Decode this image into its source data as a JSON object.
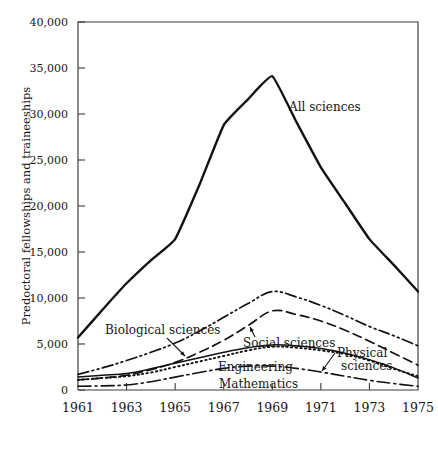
{
  "chart_data": {
    "type": "line",
    "title": "",
    "xlabel": "",
    "ylabel": "Predoctoral fellowships and traineeships",
    "x": [
      1961,
      1962,
      1963,
      1964,
      1965,
      1966,
      1967,
      1968,
      1969,
      1970,
      1971,
      1972,
      1973,
      1974,
      1975
    ],
    "xlim": [
      1961,
      1975
    ],
    "ylim": [
      0,
      40000
    ],
    "xticks": [
      1961,
      1963,
      1965,
      1967,
      1969,
      1971,
      1973,
      1975
    ],
    "xtick_labels": [
      "1961",
      "1963",
      "1965",
      "1967",
      "1969",
      "1971",
      "1973",
      "1975"
    ],
    "yticks": [
      0,
      5000,
      10000,
      15000,
      20000,
      25000,
      30000,
      35000,
      40000
    ],
    "ytick_labels": [
      "0",
      "5,000",
      "10,000",
      "15,000",
      "20,000",
      "25,000",
      "30,000",
      "35,000",
      "40,000"
    ],
    "grid": false,
    "legend_position": "inline-annotations",
    "series": [
      {
        "name": "All sciences",
        "label": "All sciences",
        "line_style": "solid",
        "line_width": 2.4,
        "color": "#121212",
        "values": [
          5700,
          8700,
          11600,
          14100,
          16400,
          22300,
          28800,
          31600,
          34100,
          29100,
          24200,
          20300,
          16400,
          13600,
          10700
        ]
      },
      {
        "name": "Biological sciences",
        "label": "Biological sciences",
        "line_style": "dash-dot-dot",
        "line_width": 1.7,
        "color": "#121212",
        "values": [
          1700,
          2400,
          3200,
          4100,
          5100,
          6400,
          7900,
          9400,
          10700,
          10100,
          9200,
          8100,
          6900,
          5900,
          4800
        ]
      },
      {
        "name": "Social sciences",
        "label": "Social sciences",
        "line_style": "dashed",
        "line_width": 1.7,
        "color": "#121212",
        "values": [
          1100,
          1300,
          1600,
          2200,
          3000,
          4100,
          5400,
          7000,
          8600,
          8200,
          7500,
          6500,
          5300,
          4000,
          2700
        ]
      },
      {
        "name": "Engineering",
        "label": "Engineering",
        "line_style": "solid",
        "line_width": 1.5,
        "color": "#121212",
        "values": [
          1400,
          1600,
          1800,
          2300,
          2900,
          3500,
          4100,
          4600,
          4900,
          4800,
          4500,
          4000,
          3300,
          2400,
          1300
        ]
      },
      {
        "name": "Physical sciences",
        "label": "Physical sciences",
        "line_style": "dotted",
        "line_width": 1.9,
        "color": "#121212",
        "values": [
          1100,
          1300,
          1500,
          1900,
          2500,
          3100,
          3700,
          4300,
          4700,
          4600,
          4300,
          3900,
          3200,
          2300,
          1500
        ]
      },
      {
        "name": "Mathematics",
        "label": "Mathematics",
        "line_style": "dash-dot",
        "line_width": 1.6,
        "color": "#121212",
        "values": [
          400,
          450,
          550,
          900,
          1400,
          1900,
          2350,
          2600,
          2600,
          2350,
          1950,
          1500,
          1050,
          700,
          400
        ]
      }
    ],
    "annotations": [
      {
        "text": "All sciences",
        "series": "All sciences",
        "x_px": 289,
        "y_px": 111,
        "has_arrow": false
      },
      {
        "text": "Biological sciences",
        "series": "Biological sciences",
        "x_px": 105,
        "y_px": 334,
        "has_arrow": true
      },
      {
        "text": "Social sciences",
        "series": "Social sciences",
        "x_px": 243,
        "y_px": 347,
        "has_arrow": true
      },
      {
        "text": "Physical sciences",
        "series": "Physical sciences",
        "x_px": 337,
        "y_px": 357,
        "has_arrow": true
      },
      {
        "text": "Engineering",
        "series": "Engineering",
        "x_px": 218,
        "y_px": 371,
        "has_arrow": false
      },
      {
        "text": "Mathematics",
        "series": "Mathematics",
        "x_px": 219,
        "y_px": 388,
        "has_arrow": false
      }
    ]
  }
}
